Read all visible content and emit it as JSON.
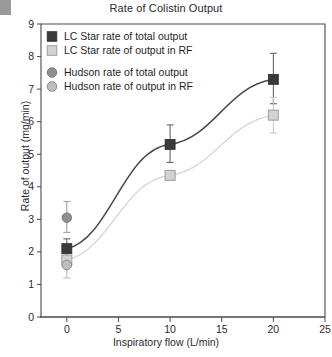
{
  "chart_data": {
    "type": "line",
    "title": "Rate of Colistin Output",
    "xlabel": "Inspiratory flow (L/min)",
    "ylabel": "Rate of output (mg/min)",
    "xlim": [
      -2.5,
      25
    ],
    "ylim": [
      0,
      9
    ],
    "xticks": [
      0,
      5,
      10,
      15,
      20,
      25
    ],
    "yticks": [
      0,
      1,
      2,
      3,
      4,
      5,
      6,
      7,
      8,
      9
    ],
    "xtick_labels": [
      "0",
      "5",
      "10",
      "15",
      "20",
      "25"
    ],
    "ytick_labels": [
      "0",
      "1",
      "2",
      "3",
      "4",
      "5",
      "6",
      "7",
      "8",
      "9"
    ],
    "grid": false,
    "legend_position": "top-left",
    "series": [
      {
        "name": "LC Star rate of total output",
        "marker": "filled-square",
        "color": "#3a3a3a",
        "line_color": "#4a4a4a",
        "x": [
          0,
          10,
          20
        ],
        "values": [
          2.1,
          5.3,
          7.3
        ],
        "yerr_lower": [
          0.25,
          0.55,
          0.75
        ],
        "yerr_upper": [
          0.3,
          0.6,
          0.8
        ]
      },
      {
        "name": "LC Star rate of output in RF",
        "marker": "open-square",
        "color": "#d2d2d2",
        "line_color": "#d9d9d9",
        "x": [
          0,
          10,
          20
        ],
        "values": [
          1.75,
          4.35,
          6.2
        ],
        "yerr_lower": [
          0.0,
          0.0,
          0.55
        ],
        "yerr_upper": [
          0.0,
          0.0,
          0.55
        ]
      },
      {
        "name": "Hudson rate of total output",
        "marker": "filled-circle",
        "color": "#8f8f8f",
        "line_color": "none",
        "x": [
          0
        ],
        "values": [
          3.05
        ],
        "yerr_lower": [
          0.45
        ],
        "yerr_upper": [
          0.5
        ]
      },
      {
        "name": "Hudson rate of output in RF",
        "marker": "open-circle",
        "color": "#bfbfbf",
        "line_color": "none",
        "x": [
          0
        ],
        "values": [
          1.6
        ],
        "yerr_lower": [
          0.4
        ],
        "yerr_upper": [
          0.15
        ]
      }
    ],
    "legend": [
      {
        "label": "LC Star rate of total output",
        "marker": "filled-square",
        "color": "#3a3a3a"
      },
      {
        "label": "LC Star rate of output in RF",
        "marker": "open-square",
        "color": "#d2d2d2"
      },
      {
        "label": "Hudson rate of total output",
        "marker": "filled-circle",
        "color": "#8f8f8f"
      },
      {
        "label": "Hudson rate of output in RF",
        "marker": "open-circle",
        "color": "#bfbfbf"
      }
    ]
  }
}
